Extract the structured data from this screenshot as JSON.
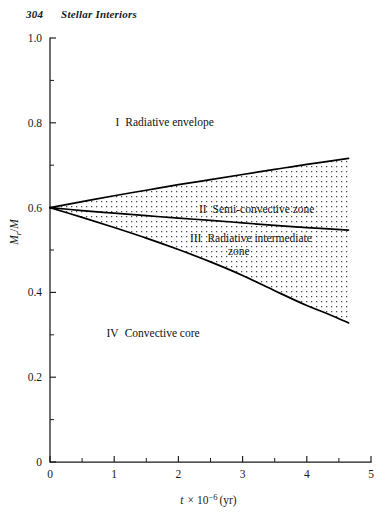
{
  "running_head": {
    "folio": "304",
    "title": "Stellar Interiors"
  },
  "chart_data": {
    "type": "line",
    "title": "",
    "xlabel": "t × 10⁻⁶ (yr)",
    "ylabel": "M_r/M",
    "xlim": [
      0,
      5
    ],
    "ylim": [
      0,
      1.0
    ],
    "grid": false,
    "legend_position": "none",
    "x_ticks": [
      0,
      1,
      2,
      3,
      4,
      5
    ],
    "x_tick_labels": [
      "0",
      "1",
      "2",
      "3",
      "4",
      "5"
    ],
    "x_minor_step": 0.5,
    "y_ticks": [
      0,
      0.2,
      0.4,
      0.6,
      0.8,
      1.0
    ],
    "y_tick_labels": [
      "0",
      "0.2",
      "0.4",
      "0.6",
      "0.8",
      "1.0"
    ],
    "y_minor_step": 0.1,
    "common_origin": [
      0,
      0.6
    ],
    "curve_x_end": 4.65,
    "shaded_region": {
      "style": "stipple-dots",
      "between": [
        "boundary_I_II",
        "boundary_III_IV"
      ],
      "dot_spacing_px": 5,
      "dot_color": "#4a4a4a"
    },
    "series": [
      {
        "name": "boundary_I_II",
        "description": "upper boundary: radiative envelope / semi-convective zone",
        "x": [
          0,
          0.5,
          1.0,
          1.5,
          2.0,
          2.5,
          3.0,
          3.5,
          4.0,
          4.65
        ],
        "y": [
          0.6,
          0.614,
          0.628,
          0.641,
          0.654,
          0.666,
          0.678,
          0.69,
          0.702,
          0.716
        ]
      },
      {
        "name": "boundary_II_III",
        "description": "middle boundary: semi-convective zone / radiative intermediate zone",
        "x": [
          0,
          0.5,
          1.0,
          1.5,
          2.0,
          2.5,
          3.0,
          3.5,
          4.0,
          4.65
        ],
        "y": [
          0.6,
          0.593,
          0.587,
          0.581,
          0.575,
          0.57,
          0.564,
          0.558,
          0.553,
          0.547
        ]
      },
      {
        "name": "boundary_III_IV",
        "description": "lower boundary: radiative intermediate zone / convective core",
        "x": [
          0,
          0.5,
          1.0,
          1.5,
          2.0,
          2.5,
          3.0,
          3.5,
          4.0,
          4.35,
          4.65
        ],
        "y": [
          0.6,
          0.577,
          0.553,
          0.528,
          0.501,
          0.472,
          0.44,
          0.404,
          0.369,
          0.348,
          0.328
        ]
      }
    ],
    "annotations": [
      {
        "id": "region-1",
        "numeral": "I",
        "text": "Radiative envelope",
        "x": 1.02,
        "y": 0.793
      },
      {
        "id": "region-2",
        "numeral": "II",
        "text": "Semi-convective zone",
        "x": 2.32,
        "y": 0.588
      },
      {
        "id": "region-3",
        "numeral": "III",
        "text": "Radiative intermediate",
        "text2": "zone",
        "x": 2.18,
        "y": 0.52
      },
      {
        "id": "region-4",
        "numeral": "IV",
        "text": "Convective core",
        "x": 0.88,
        "y": 0.295
      }
    ]
  }
}
